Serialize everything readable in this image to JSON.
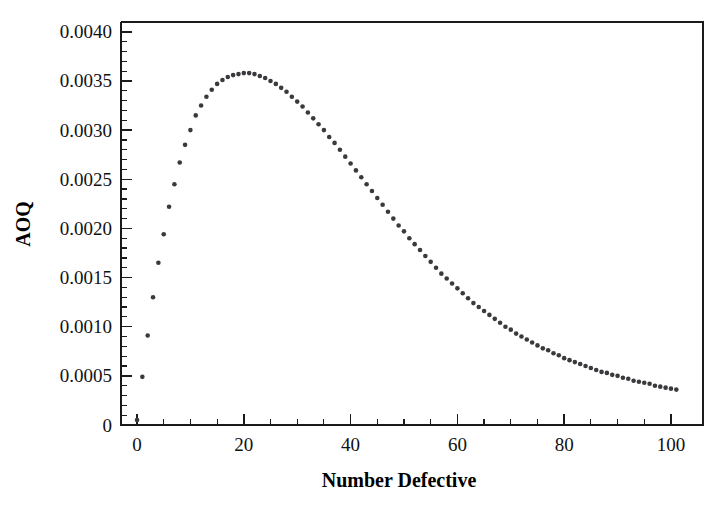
{
  "chart_data": {
    "type": "scatter",
    "title": "",
    "subtitle": "",
    "xlabel": "Number Defective",
    "ylabel": "AOQ",
    "xlim": [
      -3,
      106
    ],
    "ylim": [
      0,
      0.0041
    ],
    "grid": false,
    "legend": null,
    "annotations": [],
    "marker": {
      "shape": "circle",
      "color": "#3a3a3e",
      "size_px": 4.6
    },
    "axes": {
      "x": {
        "major_ticks": [
          0,
          20,
          40,
          60,
          80,
          100
        ],
        "major_tick_labels": [
          "0",
          "20",
          "40",
          "60",
          "80",
          "100"
        ],
        "minor_tick_step": 5,
        "minor_ticks": [
          5,
          10,
          15,
          25,
          30,
          35,
          45,
          50,
          55,
          65,
          70,
          75,
          85,
          90,
          95
        ],
        "axis_min": -3,
        "axis_max": 106
      },
      "y": {
        "major_ticks": [
          0,
          0.0005,
          0.001,
          0.0015,
          0.002,
          0.0025,
          0.003,
          0.0035,
          0.004
        ],
        "major_tick_labels": [
          "0",
          "0.0005",
          "0.0010",
          "0.0015",
          "0.0020",
          "0.0025",
          "0.0030",
          "0.0035",
          "0.0040"
        ],
        "minor_tick_step": 0.0001,
        "axis_min": 0,
        "axis_max": 0.0041
      }
    },
    "peak": {
      "x": 21,
      "y": 0.00358,
      "label": "AOQL"
    },
    "x": [
      0,
      1,
      2,
      3,
      4,
      5,
      6,
      7,
      8,
      9,
      10,
      11,
      12,
      13,
      14,
      15,
      16,
      17,
      18,
      19,
      20,
      21,
      22,
      23,
      24,
      25,
      26,
      27,
      28,
      29,
      30,
      31,
      32,
      33,
      34,
      35,
      36,
      37,
      38,
      39,
      40,
      41,
      42,
      43,
      44,
      45,
      46,
      47,
      48,
      49,
      50,
      51,
      52,
      53,
      54,
      55,
      56,
      57,
      58,
      59,
      60,
      61,
      62,
      63,
      64,
      65,
      66,
      67,
      68,
      69,
      70,
      71,
      72,
      73,
      74,
      75,
      76,
      77,
      78,
      79,
      80,
      81,
      82,
      83,
      84,
      85,
      86,
      87,
      88,
      89,
      90,
      91,
      92,
      93,
      94,
      95,
      96,
      97,
      98,
      99,
      100,
      101
    ],
    "y": [
      5e-05,
      0.00049,
      0.00091,
      0.0013,
      0.00165,
      0.00194,
      0.00222,
      0.00245,
      0.00267,
      0.00285,
      0.003,
      0.00315,
      0.00325,
      0.00334,
      0.00341,
      0.00347,
      0.00351,
      0.00354,
      0.00356,
      0.00357,
      0.00358,
      0.00358,
      0.00357,
      0.00355,
      0.00353,
      0.0035,
      0.00347,
      0.00343,
      0.00339,
      0.00334,
      0.00329,
      0.00324,
      0.00318,
      0.00312,
      0.00306,
      0.003,
      0.00293,
      0.00287,
      0.0028,
      0.00273,
      0.00266,
      0.00259,
      0.00252,
      0.00245,
      0.00238,
      0.00231,
      0.00224,
      0.00217,
      0.0021,
      0.00203,
      0.00197,
      0.0019,
      0.00184,
      0.00178,
      0.00172,
      0.00166,
      0.0016,
      0.00154,
      0.00149,
      0.00144,
      0.00139,
      0.00134,
      0.00129,
      0.00124,
      0.0012,
      0.00116,
      0.00112,
      0.00108,
      0.00104,
      0.001,
      0.00097,
      0.00093,
      0.0009,
      0.00087,
      0.00084,
      0.00081,
      0.00078,
      0.00076,
      0.00073,
      0.00071,
      0.00068,
      0.00066,
      0.00064,
      0.00062,
      0.0006,
      0.00058,
      0.00056,
      0.00054,
      0.00053,
      0.00051,
      0.0005,
      0.00048,
      0.00047,
      0.00045,
      0.00044,
      0.00043,
      0.00042,
      0.0004,
      0.00039,
      0.00038,
      0.00037,
      0.00036
    ]
  }
}
